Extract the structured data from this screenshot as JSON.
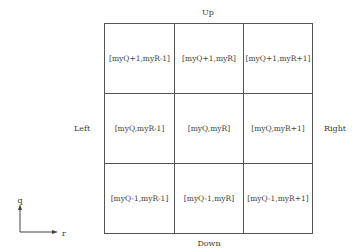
{
  "directions": {
    "up": "Up",
    "down": "Down",
    "left": "Left",
    "right": "Right"
  },
  "grid": {
    "rows": [
      [
        "[myQ+1,myR-1]",
        "[myQ+1,myR]",
        "[myQ+1,myR+1]"
      ],
      [
        "[myQ,myR-1]",
        "[myQ,myR]",
        "[myQ,myR+1]"
      ],
      [
        "[myQ-1,myR-1]",
        "[myQ-1,myR]",
        "[myQ-1,myR+1]"
      ]
    ]
  },
  "axes": {
    "vertical_label": "q",
    "horizontal_label": "r"
  },
  "colors": {
    "line": "#555555",
    "text": "#3a3a3a",
    "background": "#ffffff"
  }
}
